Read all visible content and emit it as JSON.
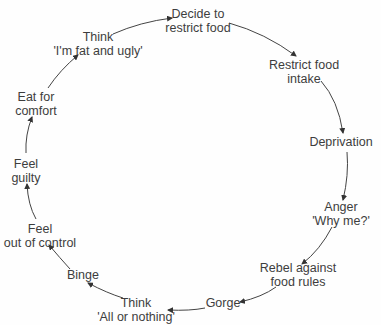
{
  "diagram": {
    "type": "cycle",
    "nodes": [
      {
        "id": "decide",
        "lines": [
          "Decide to",
          "restrict food"
        ]
      },
      {
        "id": "restrict",
        "lines": [
          "Restrict food",
          "intake"
        ]
      },
      {
        "id": "deprivation",
        "lines": [
          "Deprivation"
        ]
      },
      {
        "id": "anger",
        "lines": [
          "Anger",
          "'Why me?'"
        ]
      },
      {
        "id": "rebel",
        "lines": [
          "Rebel against",
          "food rules"
        ]
      },
      {
        "id": "gorge",
        "lines": [
          "Gorge"
        ]
      },
      {
        "id": "think_all",
        "lines": [
          "Think",
          "'All or nothing'"
        ]
      },
      {
        "id": "binge",
        "lines": [
          "Binge"
        ]
      },
      {
        "id": "out_of_control",
        "lines": [
          "Feel",
          "out of control"
        ]
      },
      {
        "id": "guilty",
        "lines": [
          "Feel",
          "guilty"
        ]
      },
      {
        "id": "comfort",
        "lines": [
          "Eat for",
          "comfort"
        ]
      },
      {
        "id": "think_fat",
        "lines": [
          "Think",
          "'I'm fat and ugly'"
        ]
      }
    ],
    "edges": [
      [
        "decide",
        "restrict"
      ],
      [
        "restrict",
        "deprivation"
      ],
      [
        "deprivation",
        "anger"
      ],
      [
        "anger",
        "rebel"
      ],
      [
        "rebel",
        "gorge"
      ],
      [
        "gorge",
        "think_all"
      ],
      [
        "think_all",
        "binge"
      ],
      [
        "binge",
        "out_of_control"
      ],
      [
        "out_of_control",
        "guilty"
      ],
      [
        "guilty",
        "comfort"
      ],
      [
        "comfort",
        "think_fat"
      ],
      [
        "think_fat",
        "decide"
      ]
    ],
    "arrow_color": "#333333",
    "text_color": "#3d3d3d"
  }
}
